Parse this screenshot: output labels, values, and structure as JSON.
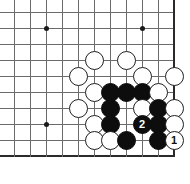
{
  "figure": {
    "board_color": "#ffffff",
    "line_color": "#6b6b6b",
    "edge_color": "#2a2a2a",
    "black_stone_color": "#0d0d0d",
    "white_stone_color": "#ffffff",
    "width": 190,
    "height": 184
  },
  "board": {
    "columns": 11,
    "rows": 10,
    "origin_x": 14,
    "origin_y": 12,
    "spacing": 16,
    "edges": [
      "bottom",
      "right"
    ],
    "star_points": [
      {
        "col": 2,
        "row": 1
      },
      {
        "col": 8,
        "row": 1
      },
      {
        "col": 2,
        "row": 7
      },
      {
        "col": 8,
        "row": 7
      }
    ]
  },
  "stones": [
    {
      "col": 5,
      "row": 3,
      "color": "white",
      "label": ""
    },
    {
      "col": 7,
      "row": 3,
      "color": "white",
      "label": ""
    },
    {
      "col": 4,
      "row": 4,
      "color": "white",
      "label": ""
    },
    {
      "col": 8,
      "row": 4,
      "color": "white",
      "label": ""
    },
    {
      "col": 10,
      "row": 4,
      "color": "white",
      "label": ""
    },
    {
      "col": 5,
      "row": 5,
      "color": "white",
      "label": ""
    },
    {
      "col": 6,
      "row": 5,
      "color": "black",
      "label": ""
    },
    {
      "col": 7,
      "row": 5,
      "color": "black",
      "label": ""
    },
    {
      "col": 8,
      "row": 5,
      "color": "black",
      "label": ""
    },
    {
      "col": 9,
      "row": 5,
      "color": "white",
      "label": ""
    },
    {
      "col": 4,
      "row": 6,
      "color": "white",
      "label": ""
    },
    {
      "col": 6,
      "row": 6,
      "color": "black",
      "label": ""
    },
    {
      "col": 8,
      "row": 6,
      "color": "white",
      "label": ""
    },
    {
      "col": 9,
      "row": 6,
      "color": "black",
      "label": ""
    },
    {
      "col": 10,
      "row": 6,
      "color": "white",
      "label": ""
    },
    {
      "col": 5,
      "row": 7,
      "color": "white",
      "label": ""
    },
    {
      "col": 6,
      "row": 7,
      "color": "black",
      "label": ""
    },
    {
      "col": 8,
      "row": 7,
      "color": "black",
      "label": "2"
    },
    {
      "col": 9,
      "row": 7,
      "color": "black",
      "label": ""
    },
    {
      "col": 10,
      "row": 7,
      "color": "white",
      "label": ""
    },
    {
      "col": 5,
      "row": 8,
      "color": "white",
      "label": ""
    },
    {
      "col": 6,
      "row": 8,
      "color": "white",
      "label": ""
    },
    {
      "col": 7,
      "row": 8,
      "color": "black",
      "label": ""
    },
    {
      "col": 9,
      "row": 8,
      "color": "black",
      "label": ""
    },
    {
      "col": 10,
      "row": 8,
      "color": "white",
      "label": "1"
    }
  ],
  "move_markers": [
    {
      "number": "1",
      "color": "white",
      "col": 10,
      "row": 8
    },
    {
      "number": "2",
      "color": "black",
      "col": 8,
      "row": 7
    }
  ]
}
